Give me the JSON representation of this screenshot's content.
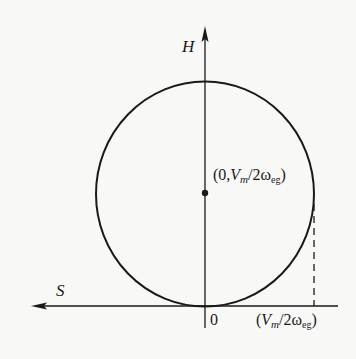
{
  "diagram": {
    "type": "phase-plane circle",
    "axes": {
      "vertical": {
        "label": "H",
        "direction": "up"
      },
      "horizontal": {
        "label": "S",
        "direction": "left"
      },
      "origin_label": "0"
    },
    "center_point": {
      "label_prefix": "(0,",
      "label_var": "V",
      "label_var_sub": "m",
      "label_slash": "/2ω",
      "label_sub": "eg",
      "label_suffix": ")",
      "full_label": "(0,Vm/2ωeg)"
    },
    "radius_marker": {
      "label_prefix": "(",
      "label_var": "V",
      "label_var_sub": "m",
      "label_slash": "/2ω",
      "label_sub": "eg",
      "label_suffix": ")",
      "full_label": "(Vm/2ωeg)"
    },
    "colors": {
      "stroke": "#1a1a1a",
      "background": "#f8f8f6"
    }
  }
}
